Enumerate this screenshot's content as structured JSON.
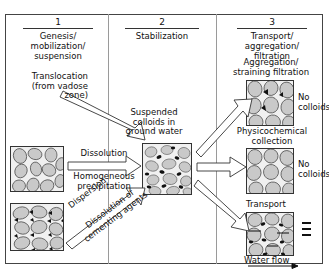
{
  "figure": {
    "title_columns": [
      {
        "num": "1",
        "caption": "Genesis/\nmobilization/\nsuspension"
      },
      {
        "num": "2",
        "caption": "Stabilization"
      },
      {
        "num": "3",
        "caption": "Transport/\naggregation/\nfiltration"
      }
    ]
  },
  "labels": {
    "translocation": "Translocation\n(from vadose\nzone)",
    "suspended": "Suspended\ncolloids in\nground water",
    "dissolution": "Dissolution",
    "homogeneous_precipitation": "Homogeneous\nprecipitation",
    "dispersion": "Dispersion",
    "dissolution_cementing": "Dissolution of\ncementing agents",
    "aggregation": "Aggregation/\nstraining filtration",
    "physicochemical": "Physicochemical\ncollection",
    "no_colloids_top": "No\ncolloids",
    "no_colloids_mid": "No\ncolloids",
    "transport": "Transport",
    "water_flow": "Water flow"
  },
  "boxes": {
    "source_unconsolidated": "unconsolidated-grains-box",
    "source_cemented": "cemented-grains-box",
    "suspended_colloids": "suspended-colloids-box",
    "aggregation_filtration": "aggregation-filtration-box",
    "physicochemical_collection": "physicochemical-collection-box",
    "transport_waterflow": "transport-waterflow-box"
  },
  "colors": {
    "grain_fill": "#c9c9c9",
    "matrix_fill": "#f0f0f0",
    "colloid_black": "#111111",
    "line": "#333333",
    "frame": "#444444"
  }
}
